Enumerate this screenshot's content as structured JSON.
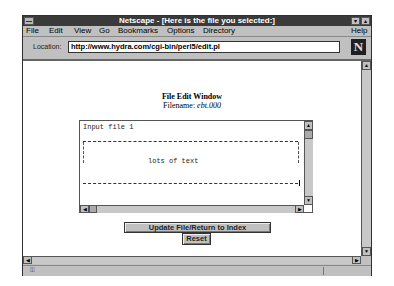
{
  "window": {
    "title": "Netscape - [Here is the file you selected:]",
    "minimize_glyph": "▾",
    "maximize_glyph": "▴"
  },
  "menu": {
    "items": [
      {
        "label": "File"
      },
      {
        "label": "Edit"
      },
      {
        "label": "View"
      },
      {
        "label": "Go"
      },
      {
        "label": "Bookmarks"
      },
      {
        "label": "Options"
      },
      {
        "label": "Directory"
      }
    ],
    "help": "Help"
  },
  "location": {
    "label": "Location:",
    "url": "http://www.hydra.com/cgi-bin/perl5/edit.pl",
    "logo_letter": "N"
  },
  "page": {
    "heading": "File Edit Window",
    "filename_label": "Filename:",
    "filename_value": "ebt.000",
    "textarea": {
      "first_line": "Input file 1",
      "body_text": "lots of text"
    },
    "buttons": {
      "update": "Update File/Return to Index",
      "reset": "Reset"
    }
  },
  "scroll_glyphs": {
    "up": "▲",
    "down": "▼",
    "left": "◀",
    "right": "▶"
  },
  "status": {
    "security_icon": "⚿"
  },
  "colors": {
    "title_bar": "#3a3a3a",
    "chrome": "#c0c0c0",
    "content_bg": "#ffffff"
  }
}
